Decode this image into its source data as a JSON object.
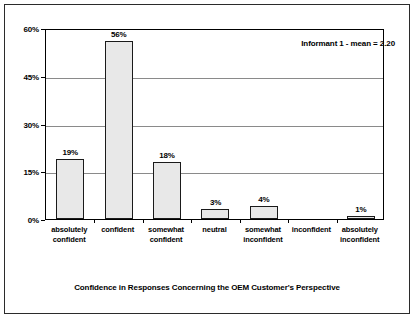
{
  "chart_data": {
    "type": "bar",
    "title": "",
    "subtitle": "",
    "xlabel": "Confidence in Responses Concerning the OEM Customer's Perspective",
    "ylabel": "",
    "categories": [
      "absolutely confident",
      "confident",
      "somewhat confident",
      "neutral",
      "somewhat inconfident",
      "inconfident",
      "absolutely inconfident"
    ],
    "category_lines": [
      [
        "absolutely",
        "confident"
      ],
      [
        "confident",
        ""
      ],
      [
        "somewhat",
        "confident"
      ],
      [
        "neutral",
        ""
      ],
      [
        "somewhat",
        "inconfident"
      ],
      [
        "inconfident",
        ""
      ],
      [
        "absolutely",
        "inconfident"
      ]
    ],
    "values": [
      19,
      56,
      18,
      3,
      4,
      0,
      1
    ],
    "data_labels": [
      "19%",
      "56%",
      "18%",
      "3%",
      "4%",
      "",
      "1%"
    ],
    "ylim": [
      0,
      60
    ],
    "yticks": [
      0,
      15,
      30,
      45,
      60
    ],
    "ytick_labels": [
      "0%",
      "15%",
      "30%",
      "45%",
      "60%"
    ],
    "grid": true,
    "legend": false,
    "annotations": [
      {
        "text": "Informant 1 - mean = 2.20",
        "position": "top-right"
      }
    ],
    "colors": {
      "bar_fill": "#e8e8e8",
      "bar_border": "#1a1a1a",
      "gridline": "#8a8a8a",
      "axis": "#000000",
      "background": "#ffffff",
      "frame_border": "#2b2b2b"
    }
  }
}
